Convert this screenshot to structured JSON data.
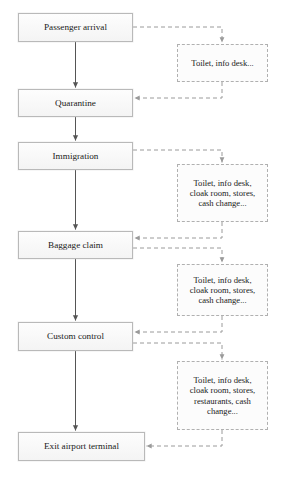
{
  "diagram": {
    "type": "flowchart",
    "orientation": "vertical",
    "colors": {
      "process_fill": "#f7f7f7",
      "process_border": "#b9b9b9",
      "service_fill": "#fcfcfc",
      "service_border": "#b0b0b0",
      "solid_connector": "#555555",
      "dashed_connector": "#9a9a9a",
      "text": "#1a1a1a",
      "background": "#ffffff"
    },
    "process_nodes": [
      {
        "id": "passenger-arrival",
        "label": "Passenger arrival",
        "x": 18,
        "y": 13,
        "w": 115,
        "h": 29
      },
      {
        "id": "quarantine",
        "label": "Quarantine",
        "x": 18,
        "y": 89,
        "w": 115,
        "h": 28
      },
      {
        "id": "immigration",
        "label": "Immigration",
        "x": 18,
        "y": 142,
        "w": 115,
        "h": 28
      },
      {
        "id": "baggage-claim",
        "label": "Baggage claim",
        "x": 18,
        "y": 231,
        "w": 115,
        "h": 28
      },
      {
        "id": "custom-control",
        "label": "Custom control",
        "x": 18,
        "y": 322,
        "w": 115,
        "h": 29
      },
      {
        "id": "exit-airport-terminal",
        "label": "Exit airport terminal",
        "x": 18,
        "y": 432,
        "w": 127,
        "h": 29
      }
    ],
    "service_nodes": [
      {
        "id": "services-1",
        "label": "Toilet, info desk...",
        "x": 177,
        "y": 44,
        "w": 91,
        "h": 38
      },
      {
        "id": "services-2",
        "label": "Toilet, info desk,\ncloak room, stores,\ncash change...",
        "x": 177,
        "y": 164,
        "w": 91,
        "h": 58
      },
      {
        "id": "services-3",
        "label": "Toilet, info desk,\ncloak room, stores,\ncash change...",
        "x": 177,
        "y": 264,
        "w": 91,
        "h": 52
      },
      {
        "id": "services-4",
        "label": "Toilet, info desk,\ncloak room, stores,\nrestaurants, cash\nchange...",
        "x": 177,
        "y": 361,
        "w": 91,
        "h": 69
      }
    ],
    "solid_connectors": [
      {
        "id": "arrival-to-quarantine",
        "from": "passenger-arrival",
        "to": "quarantine"
      },
      {
        "id": "quarantine-to-immigration",
        "from": "quarantine",
        "to": "immigration"
      },
      {
        "id": "immigration-to-baggage",
        "from": "immigration",
        "to": "baggage-claim"
      },
      {
        "id": "baggage-to-custom",
        "from": "baggage-claim",
        "to": "custom-control"
      },
      {
        "id": "custom-to-exit",
        "from": "custom-control",
        "to": "exit-airport-terminal"
      }
    ],
    "dashed_connectors": [
      {
        "id": "arrival-to-services-1",
        "from": "passenger-arrival",
        "to": "services-1",
        "direction": "to-service"
      },
      {
        "id": "services-1-to-quarantine",
        "from": "services-1",
        "to": "quarantine",
        "direction": "to-process"
      },
      {
        "id": "immigration-to-services-2",
        "from": "immigration",
        "to": "services-2",
        "direction": "to-service"
      },
      {
        "id": "services-2-to-baggage",
        "from": "services-2",
        "to": "baggage-claim",
        "direction": "to-process"
      },
      {
        "id": "baggage-to-services-3",
        "from": "baggage-claim",
        "to": "services-3",
        "direction": "to-service"
      },
      {
        "id": "services-3-to-custom",
        "from": "services-3",
        "to": "custom-control",
        "direction": "to-process"
      },
      {
        "id": "custom-to-services-4",
        "from": "custom-control",
        "to": "services-4",
        "direction": "to-service"
      },
      {
        "id": "services-4-to-exit",
        "from": "services-4",
        "to": "exit-airport-terminal",
        "direction": "to-process"
      }
    ]
  }
}
